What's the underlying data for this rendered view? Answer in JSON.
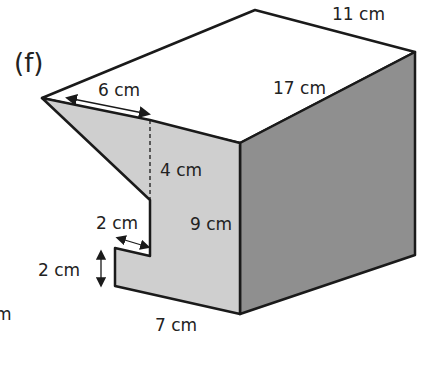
{
  "figure": {
    "label": "(f)",
    "colors": {
      "outline": "#1a1a1a",
      "front_face": "#cfcfcf",
      "side_face": "#8f8f8f",
      "top_face": "#ffffff"
    }
  },
  "dimensions": {
    "top_back": "11 cm",
    "top_depth": "17 cm",
    "slant_top": "6 cm",
    "dashed_height": "4 cm",
    "total_height": "9 cm",
    "notch_width": "2 cm",
    "notch_height": "2 cm",
    "base_width": "7 cm",
    "cut_off_left": "m"
  }
}
